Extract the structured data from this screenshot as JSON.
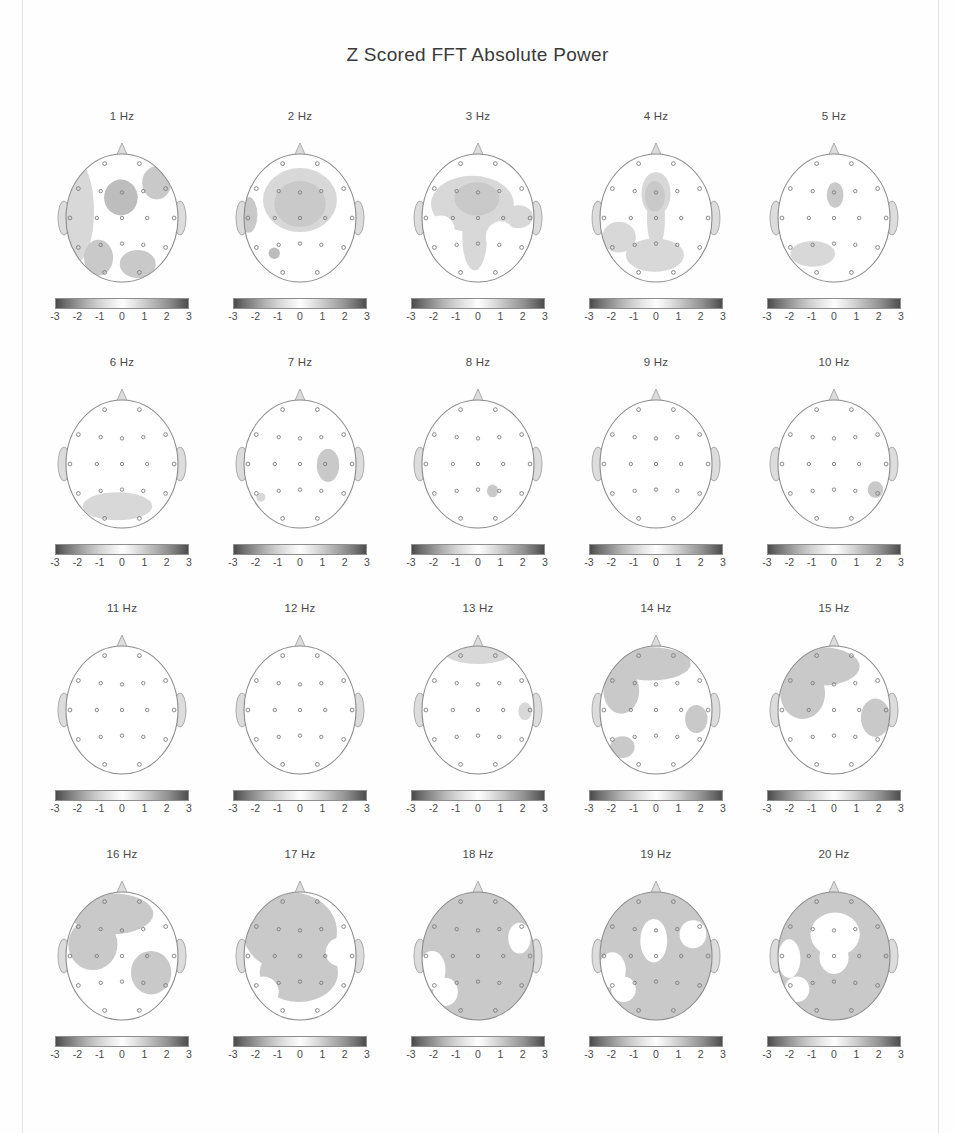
{
  "figure": {
    "title": "Z Scored FFT Absolute Power",
    "rows": 4,
    "columns": 5
  },
  "colorbar": {
    "ticks": [
      "-3",
      "-2",
      "-1",
      "0",
      "1",
      "2",
      "3"
    ],
    "min": -3,
    "max": 3,
    "low_color": "#4a4a4a",
    "mid_color": "#fdfdfd",
    "high_color": "#4d4d4d"
  },
  "chart_data": {
    "type": "heatmap",
    "title": "Z Scored FFT Absolute Power",
    "subtitle": "",
    "xlabel": "",
    "ylabel": "",
    "colorbar_label": "Z score",
    "colorbar_range": [
      -3,
      3
    ],
    "colorbar_ticks": [
      -3,
      -2,
      -1,
      0,
      1,
      2,
      3
    ],
    "grid": false,
    "legend_position": "below each panel",
    "panel_layout": {
      "rows": 4,
      "cols": 5
    },
    "montage": "19-channel international 10-20",
    "electrodes": [
      "Fp1",
      "Fp2",
      "F7",
      "F3",
      "Fz",
      "F4",
      "F8",
      "T3",
      "C3",
      "Cz",
      "C4",
      "T4",
      "T5",
      "P3",
      "Pz",
      "P4",
      "T6",
      "O1",
      "O2"
    ],
    "panels": [
      {
        "label": "1 Hz",
        "frequency_hz": 1,
        "shading": "moderate",
        "description": "Broad gray band around left lateral rim, right frontal patch, central blob, and left posterior patch",
        "approx_z_peak": 1.5
      },
      {
        "label": "2 Hz",
        "frequency_hz": 2,
        "shading": "moderate",
        "description": "Large central-frontal gray region extending bilaterally, left temporal patch",
        "approx_z_peak": 1.6
      },
      {
        "label": "3 Hz",
        "frequency_hz": 3,
        "shading": "moderate",
        "description": "Wide frontal-central gray mass with white islands right parietal and left temporal",
        "approx_z_peak": 1.7
      },
      {
        "label": "4 Hz",
        "frequency_hz": 4,
        "shading": "moderate",
        "description": "Midline anterior-posterior gray band with left temporal-posterior gray wing",
        "approx_z_peak": 1.5
      },
      {
        "label": "5 Hz",
        "frequency_hz": 5,
        "shading": "light",
        "description": "Small frontal-central blob and left posterior band",
        "approx_z_peak": 1.3
      },
      {
        "label": "6 Hz",
        "frequency_hz": 6,
        "shading": "light",
        "description": "Posterior occipital band only",
        "approx_z_peak": 1.2
      },
      {
        "label": "7 Hz",
        "frequency_hz": 7,
        "shading": "light",
        "description": "Right central-temporal blob",
        "approx_z_peak": 1.4
      },
      {
        "label": "8 Hz",
        "frequency_hz": 8,
        "shading": "minimal",
        "description": "Small right parietal spot",
        "approx_z_peak": 1.1
      },
      {
        "label": "9 Hz",
        "frequency_hz": 9,
        "shading": "none",
        "description": "Essentially flat, near zero everywhere",
        "approx_z_peak": 0.4
      },
      {
        "label": "10 Hz",
        "frequency_hz": 10,
        "shading": "minimal",
        "description": "Small right posterior-temporal spot",
        "approx_z_peak": 1.0
      },
      {
        "label": "11 Hz",
        "frequency_hz": 11,
        "shading": "none",
        "description": "Essentially flat, near zero everywhere",
        "approx_z_peak": 0.3
      },
      {
        "label": "12 Hz",
        "frequency_hz": 12,
        "shading": "none",
        "description": "Essentially flat, near zero everywhere",
        "approx_z_peak": 0.3
      },
      {
        "label": "13 Hz",
        "frequency_hz": 13,
        "shading": "light",
        "description": "Thin anterior frontal band and small right temporal spot",
        "approx_z_peak": 1.1
      },
      {
        "label": "14 Hz",
        "frequency_hz": 14,
        "shading": "moderate",
        "description": "Frontal gray sweeping to left temporal, right temporal patch, left occipital patch",
        "approx_z_peak": 1.6
      },
      {
        "label": "15 Hz",
        "frequency_hz": 15,
        "shading": "strong",
        "description": "Large left frontal-temporal gray region plus right temporal-parietal patch",
        "approx_z_peak": 1.8
      },
      {
        "label": "16 Hz",
        "frequency_hz": 16,
        "shading": "strong",
        "description": "Broad frontal-left gray region joined to right central-parietal patch",
        "approx_z_peak": 1.9
      },
      {
        "label": "17 Hz",
        "frequency_hz": 17,
        "shading": "strong",
        "description": "Most of head gray except right parietal white wedge and lower-left rim",
        "approx_z_peak": 2.0
      },
      {
        "label": "18 Hz",
        "frequency_hz": 18,
        "shading": "very strong",
        "description": "Nearly whole head gray with white notches at right temporal and left temporal-occipital",
        "approx_z_peak": 2.2
      },
      {
        "label": "19 Hz",
        "frequency_hz": 19,
        "shading": "very strong",
        "description": "Whole head gray with central white oval and lateral white notches",
        "approx_z_peak": 2.2
      },
      {
        "label": "20 Hz",
        "frequency_hz": 20,
        "shading": "strong",
        "description": "Gray periphery with large central white region spanning frontal-central midline",
        "approx_z_peak": 2.0
      }
    ]
  }
}
